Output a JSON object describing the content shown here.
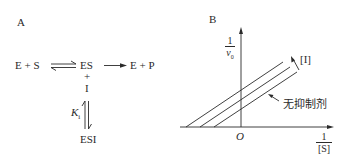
{
  "panel_a": {
    "label": "A",
    "reaction": {
      "left": "E + S",
      "complex": "ES",
      "product": "E + P",
      "plus": "+",
      "inhibitor": "I",
      "constant_main": "K",
      "constant_sub": "i",
      "ternary": "ESI"
    }
  },
  "panel_b": {
    "label": "B",
    "y_axis_num": "1",
    "y_axis_den": "v",
    "y_axis_den_sub": "0",
    "x_axis_num": "1",
    "x_axis_den": "[S]",
    "origin": "O",
    "arrow_label": "[I]",
    "no_inhibitor_label": "无抑制剂"
  },
  "colors": {
    "ink": "#2a2a2a",
    "background": "#ffffff"
  }
}
